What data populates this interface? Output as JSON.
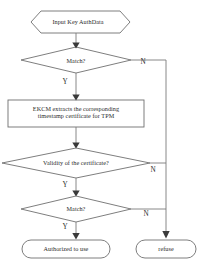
{
  "diagram": {
    "type": "flowchart",
    "colors": {
      "shape_stroke": "#6f6f6f",
      "connector": "#7a7a7a",
      "arrow": "#3a3a3a",
      "text": "#2b2b2b",
      "background": "#ffffff"
    },
    "nodes": {
      "start": {
        "shape": "hexagon",
        "text": "Input Key AuthData"
      },
      "decision_match_1": {
        "shape": "diamond",
        "text": "Match?"
      },
      "process_ekcm": {
        "shape": "rectangle",
        "text": "EKCM extracts the corresponding\ntimestamp certificate for TPM"
      },
      "decision_validity": {
        "shape": "diamond",
        "text": "Validity of the certificate?"
      },
      "decision_match_2": {
        "shape": "diamond",
        "text": "Match?"
      },
      "terminal_authorized": {
        "shape": "rounded",
        "text": "Authorized to use"
      },
      "terminal_refuse": {
        "shape": "rounded",
        "text": "refuse"
      }
    },
    "branch_labels": {
      "yes_1": "Y",
      "no_1": "N",
      "yes_2": "Y",
      "no_2": "N",
      "yes_3": "Y",
      "no_3": "N"
    }
  }
}
